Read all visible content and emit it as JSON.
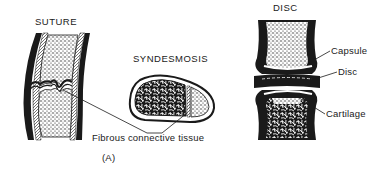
{
  "figure": {
    "panel_label": "(A)",
    "sections": [
      {
        "id": "suture",
        "title": "SUTURE"
      },
      {
        "id": "syndesmosis",
        "title": "SYNDESMOSIS"
      },
      {
        "id": "disc",
        "title": "DISC"
      }
    ],
    "shared_label": "Fibrous connective tissue",
    "disc_labels": [
      "Capsule",
      "Disc",
      "Cartilage"
    ]
  },
  "colors": {
    "ink": "#1a1a1a",
    "background": "#ffffff"
  }
}
